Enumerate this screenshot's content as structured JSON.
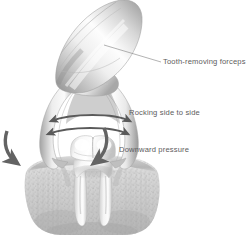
{
  "figure": {
    "background_color": "#ffffff",
    "width": 247,
    "height": 241
  },
  "annotations": [
    {
      "id": "forceps",
      "text": "Tooth-removing forceps",
      "color": "#5d5d5d",
      "has_leader_line": true,
      "leader_from": [
        105,
        45
      ],
      "leader_to": [
        161,
        62
      ]
    },
    {
      "id": "rocking",
      "text": "Rocking side to side",
      "color": "#5d5d5d",
      "has_leader_line": false
    },
    {
      "id": "pressure",
      "text": "Downward pressure",
      "color": "#5d5d5d",
      "has_leader_line": false
    }
  ],
  "illustration": {
    "style": "grayscale medical line drawing with airbrush shading",
    "parts": [
      "forceps-handle",
      "forceps-hinge",
      "forceps-left-beak",
      "forceps-right-beak",
      "molar-tooth-crown",
      "molar-tooth-roots",
      "gingiva-gum-tissue",
      "alveolar-bone"
    ],
    "arrows": [
      {
        "name": "rocking-arrow-upper",
        "type": "double-headed-horizontal",
        "color": "#5a5a5a"
      },
      {
        "name": "rocking-arrow-lower",
        "type": "double-headed-horizontal",
        "color": "#5a5a5a"
      },
      {
        "name": "pressure-arrow-left",
        "type": "curved-single-headed",
        "color": "#6b6b6b"
      },
      {
        "name": "pressure-arrow-right",
        "type": "curved-single-headed",
        "color": "#6b6b6b"
      }
    ],
    "colors": {
      "metal_light": "#fbfbfb",
      "metal_mid": "#c9c9c9",
      "metal_dark": "#8e8e8e",
      "tooth_light": "#fdfdfd",
      "tooth_shadow": "#d4d4d4",
      "bone_light": "#e6e6e6",
      "bone_mid": "#c4c4c4",
      "bone_dark": "#a0a0a0",
      "arrow": "#5a5a5a"
    }
  }
}
